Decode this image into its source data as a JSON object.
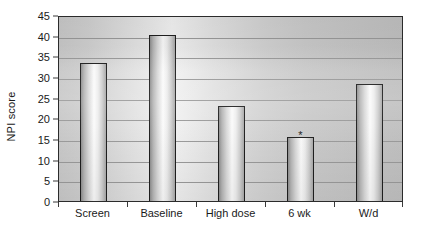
{
  "chart_data": {
    "type": "bar",
    "title": "",
    "subtitle": "",
    "xlabel": "",
    "ylabel": "NPI score",
    "categories": [
      "Screen",
      "Baseline",
      "High dose",
      "6 wk",
      "W/d"
    ],
    "values": [
      33.5,
      40.2,
      23.0,
      15.5,
      28.3
    ],
    "ylim": [
      0,
      45
    ],
    "y_ticks": [
      0,
      5,
      10,
      15,
      20,
      25,
      30,
      35,
      40,
      45
    ],
    "y_tick_labels": [
      "0",
      "5",
      "10",
      "15",
      "20",
      "25",
      "30",
      "35",
      "40",
      "45"
    ],
    "grid": true,
    "grid_axis": "y",
    "legend": false,
    "legend_position": "none",
    "annotations": [
      {
        "text": "*",
        "category": "6 wk",
        "value": 17.6,
        "meaning": "significance-marker"
      }
    ],
    "series": [
      {
        "name": "NPI score",
        "values": [
          33.5,
          40.2,
          23.0,
          15.5,
          28.3
        ]
      }
    ]
  },
  "style": {
    "plot_background": "#d4d4d4",
    "bar_edge_color": "#1f1f1f",
    "bar_fill_light": "#fbfbfb",
    "bar_fill_dark": "#8f8f8f",
    "gridline_color": "#9a9a9a",
    "axis_color": "#2b2b2b",
    "text_color": "#1a1a1a"
  }
}
